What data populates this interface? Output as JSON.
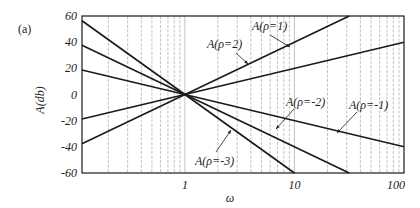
{
  "panel_label": "(a)",
  "chart_data": {
    "type": "line",
    "title": "",
    "xlabel": "ω",
    "ylabel": "A(db)",
    "xscale": "log",
    "xlim": [
      0.115,
      100
    ],
    "ylim": [
      -60,
      60
    ],
    "x_ticks": [
      "1",
      "10",
      "100"
    ],
    "y_ticks": [
      "60",
      "40",
      "20",
      "0",
      "-20",
      "-40",
      "-60"
    ],
    "grid": "vertical log gridlines",
    "series": [
      {
        "name": "A(ρ=1)",
        "slope_db_per_decade": 20,
        "points": [
          [
            0.115,
            -18.8
          ],
          [
            1,
            0
          ],
          [
            100,
            40
          ]
        ]
      },
      {
        "name": "A(ρ=2)",
        "slope_db_per_decade": 40,
        "points": [
          [
            0.115,
            -37.6
          ],
          [
            1,
            0
          ],
          [
            31.6,
            60
          ]
        ]
      },
      {
        "name": "A(ρ=-1)",
        "slope_db_per_decade": -20,
        "points": [
          [
            0.115,
            18.8
          ],
          [
            1,
            0
          ],
          [
            100,
            -40
          ]
        ]
      },
      {
        "name": "A(ρ=-2)",
        "slope_db_per_decade": -40,
        "points": [
          [
            0.115,
            37.6
          ],
          [
            1,
            0
          ],
          [
            31.6,
            -60
          ]
        ]
      },
      {
        "name": "A(ρ=-3)",
        "slope_db_per_decade": -60,
        "points": [
          [
            0.115,
            56.4
          ],
          [
            1,
            0
          ],
          [
            10,
            -60
          ]
        ]
      }
    ],
    "annotations": [
      {
        "text": "A(ρ=1)",
        "target_series": "A(ρ=1)"
      },
      {
        "text": "A(ρ=2)",
        "target_series": "A(ρ=2)"
      },
      {
        "text": "A(ρ=-1)",
        "target_series": "A(ρ=-1)"
      },
      {
        "text": "A(ρ=-2)",
        "target_series": "A(ρ=-2)"
      },
      {
        "text": "A(ρ=-3)",
        "target_series": "A(ρ=-3)"
      }
    ]
  }
}
